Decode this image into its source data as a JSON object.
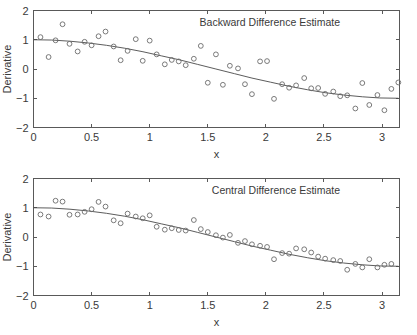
{
  "figure": {
    "width": 417,
    "height": 335,
    "background": "#ffffff",
    "ink_color": "#3a3a3a",
    "marker_color": "#6b6b6b",
    "line_color": "#4a4a4a"
  },
  "chart_data": [
    {
      "type": "scatter",
      "title": "Backward Difference Estimate",
      "xlabel": "x",
      "ylabel": "Derivative",
      "xlim": [
        0,
        3.15
      ],
      "ylim": [
        -2,
        2
      ],
      "xticks": [
        0,
        0.5,
        1,
        1.5,
        2,
        2.5,
        3
      ],
      "xticklabels": [
        "0",
        "0.5",
        "1",
        "1.5",
        "2",
        "2.5",
        "3"
      ],
      "yticks": [
        -2,
        -1,
        0,
        1,
        2
      ],
      "yticklabels": [
        "-2",
        "-1",
        "0",
        "1",
        "2"
      ],
      "grid": false,
      "legend": "none",
      "series": [
        {
          "name": "backward difference samples",
          "marker": "circle",
          "x": [
            0.06,
            0.13,
            0.19,
            0.25,
            0.31,
            0.38,
            0.44,
            0.5,
            0.56,
            0.62,
            0.69,
            0.75,
            0.81,
            0.88,
            0.94,
            1.0,
            1.06,
            1.13,
            1.19,
            1.25,
            1.31,
            1.38,
            1.44,
            1.5,
            1.57,
            1.63,
            1.69,
            1.76,
            1.82,
            1.88,
            1.95,
            2.01,
            2.07,
            2.14,
            2.2,
            2.26,
            2.33,
            2.39,
            2.45,
            2.51,
            2.58,
            2.64,
            2.7,
            2.77,
            2.83,
            2.89,
            2.96,
            3.02,
            3.08,
            3.14
          ],
          "y": [
            1.09,
            0.41,
            0.98,
            1.53,
            0.86,
            0.6,
            0.93,
            0.81,
            1.12,
            1.28,
            0.77,
            0.3,
            0.62,
            1.02,
            0.28,
            0.97,
            0.5,
            0.16,
            0.31,
            0.26,
            0.13,
            0.35,
            0.79,
            -0.47,
            0.5,
            -0.54,
            0.11,
            0.02,
            -0.52,
            -0.86,
            0.26,
            0.27,
            -1.02,
            -0.52,
            -0.64,
            -0.56,
            -0.31,
            -0.66,
            -0.65,
            -0.85,
            -0.77,
            -0.93,
            -0.9,
            -1.35,
            -0.48,
            -1.23,
            -0.89,
            -1.41,
            -0.68,
            -0.46
          ]
        }
      ],
      "fit_curve": {
        "name": "true derivative",
        "description": "smooth cosine-like reference curve from +1 down to -1",
        "x": [
          0.0,
          0.157,
          0.314,
          0.471,
          0.628,
          0.785,
          0.942,
          1.1,
          1.26,
          1.41,
          1.57,
          1.73,
          1.88,
          2.04,
          2.2,
          2.36,
          2.51,
          2.67,
          2.83,
          2.98,
          3.14
        ],
        "y": [
          1.0,
          0.99,
          0.95,
          0.89,
          0.81,
          0.71,
          0.59,
          0.45,
          0.31,
          0.16,
          0.0,
          -0.16,
          -0.31,
          -0.45,
          -0.59,
          -0.71,
          -0.81,
          -0.89,
          -0.95,
          -0.99,
          -1.0
        ]
      }
    },
    {
      "type": "scatter",
      "title": "Central Difference Estimate",
      "xlabel": "x",
      "ylabel": "Derivative",
      "xlim": [
        0,
        3.15
      ],
      "ylim": [
        -2,
        2
      ],
      "xticks": [
        0,
        0.5,
        1,
        1.5,
        2,
        2.5,
        3
      ],
      "xticklabels": [
        "0",
        "0.5",
        "1",
        "1.5",
        "2",
        "2.5",
        "3"
      ],
      "yticks": [
        -2,
        -1,
        0,
        1,
        2
      ],
      "yticklabels": [
        "-2",
        "-1",
        "0",
        "1",
        "2"
      ],
      "grid": false,
      "legend": "none",
      "series": [
        {
          "name": "central difference samples",
          "marker": "circle",
          "x": [
            0.06,
            0.13,
            0.19,
            0.25,
            0.31,
            0.38,
            0.44,
            0.5,
            0.56,
            0.62,
            0.69,
            0.75,
            0.81,
            0.88,
            0.94,
            1.0,
            1.06,
            1.13,
            1.19,
            1.25,
            1.31,
            1.38,
            1.44,
            1.5,
            1.57,
            1.63,
            1.69,
            1.76,
            1.82,
            1.88,
            1.95,
            2.01,
            2.07,
            2.14,
            2.2,
            2.26,
            2.33,
            2.39,
            2.45,
            2.51,
            2.58,
            2.64,
            2.7,
            2.77,
            2.83,
            2.89,
            2.96,
            3.02,
            3.08
          ],
          "y": [
            0.77,
            0.7,
            1.24,
            1.21,
            0.76,
            0.77,
            0.86,
            0.95,
            1.2,
            1.04,
            0.57,
            0.47,
            0.8,
            0.7,
            0.64,
            0.74,
            0.35,
            0.25,
            0.3,
            0.24,
            0.22,
            0.58,
            0.27,
            0.17,
            0.06,
            -0.02,
            0.07,
            -0.2,
            -0.14,
            -0.25,
            -0.3,
            -0.34,
            -0.76,
            -0.55,
            -0.57,
            -0.39,
            -0.42,
            -0.53,
            -0.67,
            -0.74,
            -0.79,
            -0.82,
            -1.12,
            -0.92,
            -1.04,
            -0.76,
            -1.04,
            -0.95,
            -0.92
          ]
        }
      ],
      "fit_curve": {
        "name": "true derivative",
        "description": "smooth cosine-like reference curve from +1 down to -1",
        "x": [
          0.0,
          0.157,
          0.314,
          0.471,
          0.628,
          0.785,
          0.942,
          1.1,
          1.26,
          1.41,
          1.57,
          1.73,
          1.88,
          2.04,
          2.2,
          2.36,
          2.51,
          2.67,
          2.83,
          2.98,
          3.14
        ],
        "y": [
          1.0,
          0.99,
          0.95,
          0.89,
          0.81,
          0.71,
          0.59,
          0.45,
          0.31,
          0.16,
          0.0,
          -0.16,
          -0.31,
          -0.45,
          -0.59,
          -0.71,
          -0.81,
          -0.89,
          -0.95,
          -0.99,
          -1.0
        ]
      }
    }
  ]
}
